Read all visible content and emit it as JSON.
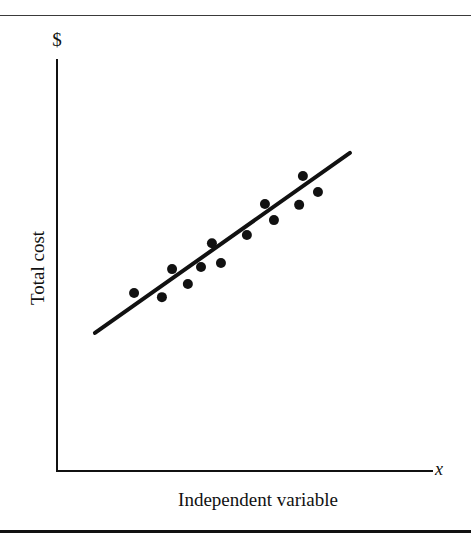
{
  "chart_data": {
    "type": "scatter",
    "title": "",
    "xlabel": "Independent variable",
    "ylabel": "Total cost",
    "x_axis_symbol": "x",
    "y_axis_symbol": "$",
    "xlim": [
      0,
      100
    ],
    "ylim": [
      0,
      100
    ],
    "grid": false,
    "legend": null,
    "tick_labels": {
      "x": [],
      "y": []
    },
    "series": [
      {
        "name": "observations",
        "kind": "scatter",
        "points": [
          {
            "x": 20.5,
            "y": 43.2
          },
          {
            "x": 27.9,
            "y": 42.2
          },
          {
            "x": 30.6,
            "y": 49.0
          },
          {
            "x": 34.8,
            "y": 45.4
          },
          {
            "x": 38.3,
            "y": 49.5
          },
          {
            "x": 41.2,
            "y": 55.3
          },
          {
            "x": 43.6,
            "y": 50.5
          },
          {
            "x": 50.5,
            "y": 57.3
          },
          {
            "x": 55.3,
            "y": 64.8
          },
          {
            "x": 57.7,
            "y": 60.9
          },
          {
            "x": 64.4,
            "y": 64.6
          },
          {
            "x": 65.4,
            "y": 71.6
          },
          {
            "x": 69.4,
            "y": 67.7
          }
        ]
      },
      {
        "name": "fitted line",
        "kind": "line",
        "points": [
          {
            "x": 10.1,
            "y": 33.5
          },
          {
            "x": 77.9,
            "y": 77.2
          }
        ]
      }
    ]
  },
  "plot_geometry": {
    "origin_px": [
      57,
      471
    ],
    "x_axis_end_px": 433,
    "y_axis_top_px": 59
  },
  "colors": {
    "ink": "#111111",
    "background": "#ffffff"
  }
}
